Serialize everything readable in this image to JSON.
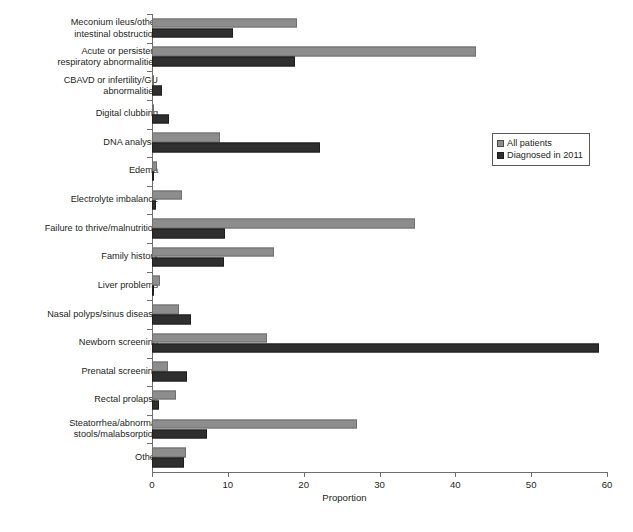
{
  "chart_data": {
    "type": "bar",
    "orientation": "horizontal",
    "title": "",
    "xlabel": "Proportion",
    "ylabel": "",
    "xlim": [
      0,
      60
    ],
    "xticks": [
      0,
      10,
      20,
      30,
      40,
      50,
      60
    ],
    "grid": false,
    "legend_position": "right-upper",
    "categories": [
      "Meconium ileus/other\nintestinal obstruction",
      "Acute or persistent\nrespiratory abnormalities",
      "CBAVD or infertility/GU\nabnormalities",
      "Digital clubbing",
      "DNA analysis",
      "Edema",
      "Electrolyte imbalance",
      "Failure to thrive/malnutrition",
      "Family history",
      "Liver problems",
      "Nasal polyps/sinus disease",
      "Newborn screening",
      "Prenatal screening",
      "Rectal prolapse",
      "Steatorrhea/abnormal\nstools/malabsorption",
      "Other"
    ],
    "series": [
      {
        "name": "All patients",
        "color": "#8d8d8d",
        "values": [
          19.1,
          42.7,
          0.3,
          0.2,
          9.0,
          0.7,
          3.9,
          34.7,
          16.1,
          1.1,
          3.6,
          15.1,
          2.1,
          3.1,
          27.0,
          4.5
        ]
      },
      {
        "name": "Diagnosed in 2011",
        "color": "#2f2f2f",
        "values": [
          10.7,
          18.9,
          1.3,
          2.2,
          22.2,
          0.1,
          0.5,
          9.6,
          9.5,
          0.15,
          5.1,
          58.9,
          4.6,
          0.9,
          7.3,
          4.2
        ]
      }
    ]
  },
  "legend": {
    "items": [
      {
        "label": "All patients",
        "swatch": "light-gray-square-icon"
      },
      {
        "label": "Diagnosed in 2011",
        "swatch": "dark-gray-square-icon"
      }
    ]
  },
  "axis": {
    "x_title": "Proportion",
    "x_tick_labels": [
      "0",
      "10",
      "20",
      "30",
      "40",
      "50",
      "60"
    ]
  },
  "caption_fragment": ""
}
